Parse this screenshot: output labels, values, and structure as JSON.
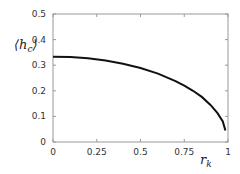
{
  "chart_data": {
    "type": "line",
    "title": "",
    "xlabel": "r_k",
    "ylabel": "⟨h_c⟩",
    "xlim": [
      0,
      1
    ],
    "ylim": [
      0,
      0.5
    ],
    "xticks": [
      "0",
      "0.25",
      "0.5",
      "0.75",
      "1"
    ],
    "yticks": [
      "0",
      "0.1",
      "0.2",
      "0.3",
      "0.4",
      "0.5"
    ],
    "grid": false,
    "series": [
      {
        "name": "h_c",
        "x": [
          0,
          0.1,
          0.2,
          0.3,
          0.4,
          0.5,
          0.6,
          0.7,
          0.75,
          0.8,
          0.85,
          0.9,
          0.94,
          0.97,
          0.985
        ],
        "y": [
          0.333,
          0.332,
          0.327,
          0.318,
          0.306,
          0.289,
          0.267,
          0.238,
          0.22,
          0.2,
          0.176,
          0.145,
          0.113,
          0.08,
          0.045
        ]
      }
    ]
  }
}
